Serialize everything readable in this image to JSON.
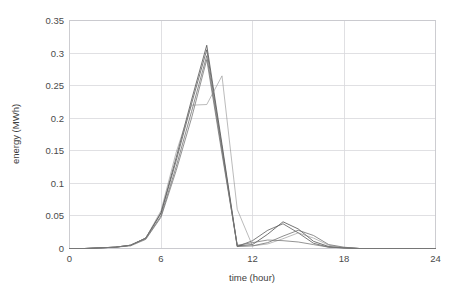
{
  "chart_data": {
    "type": "line",
    "title": "",
    "xlabel": "time (hour)",
    "ylabel": "energy (MWh)",
    "xlim": [
      0,
      24
    ],
    "ylim": [
      0,
      0.35
    ],
    "grid": true,
    "legend": "none",
    "xticks": [
      0,
      6,
      12,
      18,
      24
    ],
    "xtick_labels": [
      "0",
      "6",
      "12",
      "18",
      "24"
    ],
    "yticks": [
      0,
      0.05,
      0.1,
      0.15,
      0.2,
      0.25,
      0.3,
      0.35
    ],
    "ytick_labels": [
      "0",
      "0.05",
      "0.1",
      "0.15",
      "0.2",
      "0.25",
      "0.3",
      "0.35"
    ],
    "x": [
      0,
      1,
      2,
      3,
      4,
      5,
      6,
      7,
      8,
      9,
      10,
      11,
      12,
      13,
      14,
      15,
      16,
      17,
      18,
      19,
      20,
      21,
      22,
      23,
      24
    ],
    "series": [
      {
        "name": "profile-1",
        "color": "#4d4d4d",
        "values": [
          0.0,
          0.0,
          0.001,
          0.002,
          0.005,
          0.016,
          0.055,
          0.14,
          0.228,
          0.312,
          0.16,
          0.004,
          0.006,
          0.022,
          0.041,
          0.03,
          0.011,
          0.003,
          0.001,
          0.0,
          0.0,
          0.0,
          0.0,
          0.0,
          0.0
        ]
      },
      {
        "name": "profile-2",
        "color": "#5a5a5a",
        "values": [
          0.0,
          0.0,
          0.001,
          0.002,
          0.005,
          0.016,
          0.054,
          0.135,
          0.222,
          0.305,
          0.155,
          0.003,
          0.012,
          0.028,
          0.038,
          0.024,
          0.008,
          0.002,
          0.001,
          0.0,
          0.0,
          0.0,
          0.0,
          0.0,
          0.0
        ]
      },
      {
        "name": "profile-3",
        "color": "#6e6e6e",
        "values": [
          0.0,
          0.0,
          0.001,
          0.002,
          0.005,
          0.015,
          0.05,
          0.126,
          0.21,
          0.296,
          0.15,
          0.003,
          0.004,
          0.009,
          0.019,
          0.028,
          0.02,
          0.006,
          0.002,
          0.0,
          0.0,
          0.0,
          0.0,
          0.0,
          0.0
        ]
      },
      {
        "name": "profile-4",
        "color": "#828282",
        "values": [
          0.0,
          0.0,
          0.001,
          0.002,
          0.005,
          0.016,
          0.058,
          0.148,
          0.22,
          0.221,
          0.265,
          0.06,
          0.004,
          0.007,
          0.015,
          0.024,
          0.016,
          0.005,
          0.001,
          0.0,
          0.0,
          0.0,
          0.0,
          0.0,
          0.0
        ]
      },
      {
        "name": "profile-5",
        "color": "#767676",
        "values": [
          0.0,
          0.0,
          0.001,
          0.002,
          0.004,
          0.014,
          0.048,
          0.12,
          0.2,
          0.29,
          0.145,
          0.005,
          0.009,
          0.013,
          0.012,
          0.01,
          0.006,
          0.002,
          0.001,
          0.0,
          0.0,
          0.0,
          0.0,
          0.0,
          0.0
        ]
      }
    ]
  }
}
